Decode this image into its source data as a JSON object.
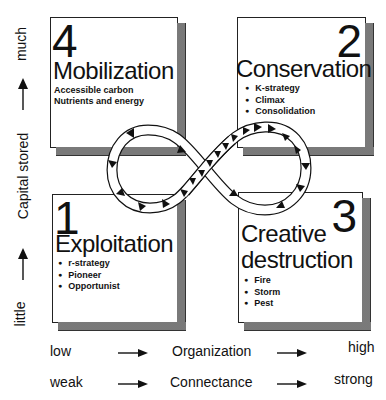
{
  "diagram": {
    "type": "adaptive-cycle",
    "y_axis": {
      "label": "Capital stored",
      "low": "little",
      "high": "much"
    },
    "x_axes": [
      {
        "low": "low",
        "label": "Organization",
        "high": "high"
      },
      {
        "low": "weak",
        "label": "Connectance",
        "high": "strong"
      }
    ],
    "phases": [
      {
        "number": "4",
        "title": "Mobilization",
        "lines": [
          "Accessible carbon",
          "Nutrients and energy"
        ],
        "position": "top-left"
      },
      {
        "number": "2",
        "title": "Conservation",
        "bullets": [
          "K-strategy",
          "Climax",
          "Consolidation"
        ],
        "position": "top-right"
      },
      {
        "number": "1",
        "title": "Exploitation",
        "bullets": [
          "r-strategy",
          "Pioneer",
          "Opportunist"
        ],
        "position": "bottom-left"
      },
      {
        "number": "3",
        "title_line1": "Creative",
        "title_line2": "destruction",
        "bullets": [
          "Fire",
          "Storm",
          "Pest"
        ],
        "position": "bottom-right"
      }
    ],
    "loop": {
      "shape": "figure-eight",
      "arrows": "directional triangles along band"
    }
  }
}
